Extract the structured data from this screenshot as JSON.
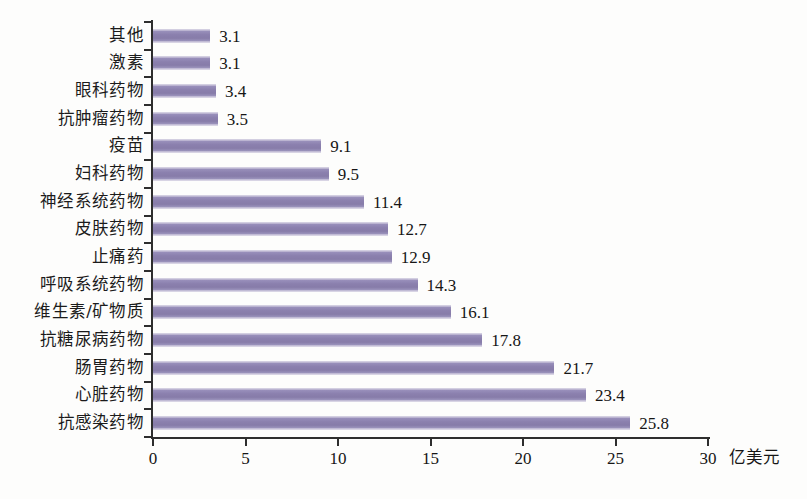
{
  "chart_data": {
    "type": "bar",
    "orientation": "horizontal",
    "title": "",
    "subtitle": "",
    "xlabel": "亿美元",
    "ylabel": "",
    "xlim": [
      0,
      30
    ],
    "xticks": [
      "0",
      "5",
      "10",
      "15",
      "20",
      "25",
      "30"
    ],
    "xtick_values": [
      0,
      5,
      10,
      15,
      20,
      25,
      30
    ],
    "grid": false,
    "legend": null,
    "bar_color": "#8b80ae",
    "axis_color": "#2e2e2e",
    "categories": [
      "其他",
      "激素",
      "眼科药物",
      "抗肿瘤药物",
      "疫苗",
      "妇科药物",
      "神经系统药物",
      "皮肤药物",
      "止痛药",
      "呼吸系统药物",
      "维生素/矿物质",
      "抗糖尿病药物",
      "肠胃药物",
      "心脏药物",
      "抗感染药物"
    ],
    "values": [
      3.1,
      3.1,
      3.4,
      3.5,
      9.1,
      9.5,
      11.4,
      12.7,
      12.9,
      14.3,
      16.1,
      17.8,
      21.7,
      23.4,
      25.8
    ],
    "value_labels": [
      "3.1",
      "3.1",
      "3.4",
      "3.5",
      "9.1",
      "9.5",
      "11.4",
      "12.7",
      "12.9",
      "14.3",
      "16.1",
      "17.8",
      "21.7",
      "23.4",
      "25.8"
    ]
  },
  "figure": {
    "caption": ""
  }
}
